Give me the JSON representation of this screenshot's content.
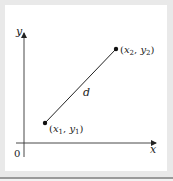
{
  "diagram": {
    "axes": {
      "x_label": "x",
      "y_label": "y",
      "origin_label": "0"
    },
    "points": [
      {
        "name": "point-1",
        "label_var_x": "x",
        "label_sub_x": "1",
        "label_var_y": "y",
        "label_sub_y": "1"
      },
      {
        "name": "point-2",
        "label_var_x": "x",
        "label_sub_x": "2",
        "label_var_y": "y",
        "label_sub_y": "2"
      }
    ],
    "segment_label": "d",
    "punct": {
      "open": "(",
      "comma": ", ",
      "close": ")"
    },
    "colors": {
      "background": "#e9e9e9",
      "panel": "#ffffff",
      "ink": "#222222",
      "bottom_rule": "#9a9a9a"
    }
  }
}
